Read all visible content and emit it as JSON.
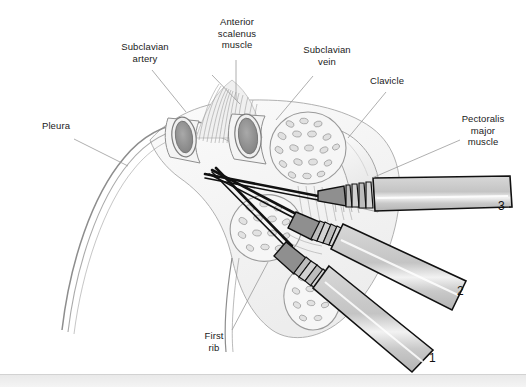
{
  "figure": {
    "background_color": "#ffffff",
    "ink_color": "#6e6e6e",
    "needle_color": "#111111",
    "syringe_fill": "#c9c9c9",
    "tissue_fill": "#f2f2f2"
  },
  "labels": {
    "pleura": "Pleura",
    "subclavian_artery": "Subclavian\nartery",
    "anterior_scalenus_muscle": "Anterior\nscalenus\nmuscle",
    "subclavian_vein": "Subclavian\nvein",
    "clavicle": "Clavicle",
    "pectoralis_major_muscle": "Pectoralis\nmajor\nmuscle",
    "first_rib": "First\nrib"
  },
  "approach_numbers": {
    "one": "1",
    "two": "2",
    "three": "3"
  },
  "structures": [
    {
      "name": "pleura",
      "kind": "membrane-curve"
    },
    {
      "name": "subclavian-artery",
      "kind": "vessel-cross-section"
    },
    {
      "name": "subclavian-vein",
      "kind": "vessel-cross-section"
    },
    {
      "name": "anterior-scalenus-muscle",
      "kind": "striated-muscle"
    },
    {
      "name": "clavicle",
      "kind": "bone"
    },
    {
      "name": "first-rib",
      "kind": "bone-cross-section"
    },
    {
      "name": "pectoralis-major-muscle",
      "kind": "muscle-cross-section"
    }
  ],
  "needles": [
    {
      "id": "3",
      "entry": "supraclavicular"
    },
    {
      "id": "2",
      "entry": "infraclavicular-lateral"
    },
    {
      "id": "1",
      "entry": "infraclavicular-inferior"
    }
  ]
}
